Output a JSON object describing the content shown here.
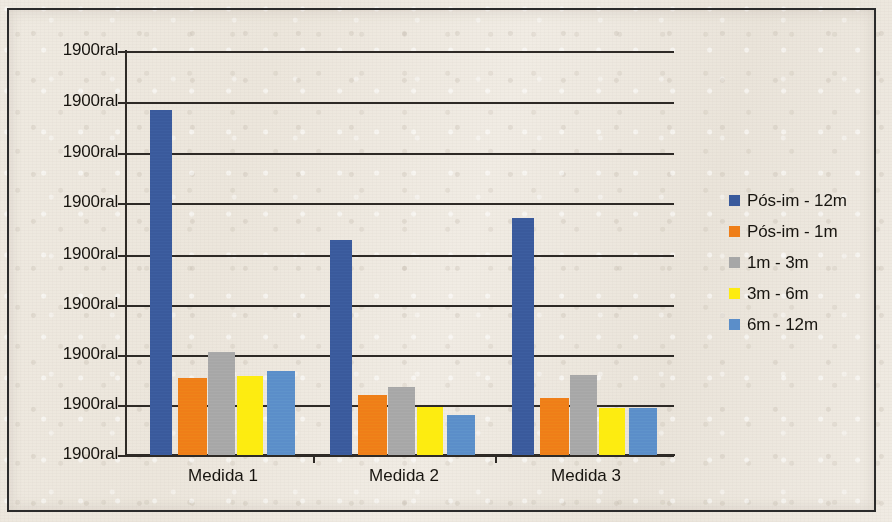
{
  "chart_data": {
    "type": "bar",
    "title": "",
    "subtitle": "",
    "xlabel": "",
    "ylabel": "",
    "grid": true,
    "legend_position": "right",
    "categories": [
      "Medida 1",
      "Medida 2",
      "Medida 3"
    ],
    "y_tick_labels": [
      "1900ral",
      "1900ral",
      "1900ral",
      "1900ral",
      "1900ral",
      "1900ral",
      "1900ral",
      "1900ral",
      "1900ral"
    ],
    "y_axis_note": "All nine y-axis tick labels read the same literal text '1900ral' (Excel date-format artifact); no numeric scale is legible.",
    "ylim": [
      0,
      8
    ],
    "y_gridline_values": [
      8,
      7,
      6,
      5,
      4,
      3,
      2,
      1,
      0
    ],
    "series": [
      {
        "name": "Pós-im - 12m",
        "color": "#3a5a9c",
        "values": [
          6.78,
          4.21,
          4.64
        ],
        "bar_top_px": [
          110,
          240,
          218
        ]
      },
      {
        "name": "Pós-im - 1m",
        "color": "#ef7e18",
        "values": [
          1.51,
          1.18,
          1.12
        ],
        "bar_top_px": [
          378,
          395,
          398
        ]
      },
      {
        "name": "1m - 3m",
        "color": "#a7a7a7",
        "values": [
          2.03,
          1.34,
          1.57
        ],
        "bar_top_px": [
          352,
          387,
          375
        ]
      },
      {
        "name": "3m - 6m",
        "color": "#fdec10",
        "values": [
          1.55,
          0.94,
          0.92
        ],
        "bar_top_px": [
          376,
          407,
          408
        ]
      },
      {
        "name": "6m - 12m",
        "color": "#5b8ec9",
        "values": [
          1.64,
          0.78,
          0.92
        ],
        "bar_top_px": [
          371,
          415,
          408
        ]
      }
    ],
    "colors": {
      "series_1": "#3a5a9c",
      "series_2": "#ef7e18",
      "series_3": "#a7a7a7",
      "series_4": "#fdec10",
      "series_5": "#5b8ec9",
      "axis": "#2e2a26",
      "text": "#17140f",
      "background": "#ece6dc",
      "frame": "#2b2b2b"
    }
  },
  "legend": {
    "items": [
      {
        "label": "Pós-im - 12m",
        "color": "#3a5a9c"
      },
      {
        "label": "Pós-im - 1m",
        "color": "#ef7e18"
      },
      {
        "label": "1m - 3m",
        "color": "#a7a7a7"
      },
      {
        "label": "3m - 6m",
        "color": "#fdec10"
      },
      {
        "label": "6m - 12m",
        "color": "#5b8ec9"
      }
    ]
  }
}
